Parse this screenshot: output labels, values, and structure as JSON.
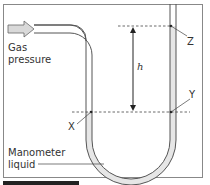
{
  "diagram": {
    "labels": {
      "gas": "Gas",
      "pressure": "pressure",
      "manometer": "Manometer",
      "liquid": "liquid",
      "height": "h",
      "point_x": "X",
      "point_y": "Y",
      "point_z": "Z"
    },
    "colors": {
      "tube_outline": "#555555",
      "liquid_fill": "#e8e8e8",
      "arrow_fill": "#d9d9d9",
      "frame": "#888888",
      "dashed": "#444444",
      "footer_bar": "#222222"
    }
  }
}
